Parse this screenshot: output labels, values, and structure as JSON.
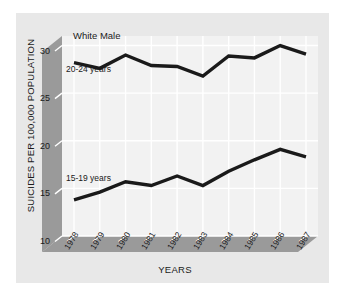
{
  "figure": {
    "background_color": "#ffffff",
    "panel_color": "#e8e8e8",
    "plot_area_color": "#f2f2f2",
    "axis_band_color": "#9a9a9a",
    "gridline_color": "#ffffff",
    "line_color": "#1a1a1a"
  },
  "annotations": {
    "title": "White Male",
    "upper_series_label": "20-24 years",
    "lower_series_label": "15-19 years"
  },
  "axes": {
    "ylabel": "SUICIDES PER 100,000 POPULATION",
    "xlabel": "YEARS",
    "yticks": [
      "30",
      "25",
      "20",
      "15",
      "10"
    ],
    "xticks": [
      "1978",
      "1979",
      "1980",
      "1981",
      "1982",
      "1983",
      "1984",
      "1985",
      "1986",
      "1987"
    ]
  },
  "chart_data": {
    "type": "line",
    "title": "White Male",
    "xlabel": "YEARS",
    "ylabel": "SUICIDES PER 100,000 POPULATION",
    "x": [
      1978,
      1979,
      1980,
      1981,
      1982,
      1983,
      1984,
      1985,
      1986,
      1987
    ],
    "categories": [
      "1978",
      "1979",
      "1980",
      "1981",
      "1982",
      "1983",
      "1984",
      "1985",
      "1986",
      "1987"
    ],
    "ylim": [
      10,
      31
    ],
    "yticks": [
      10,
      15,
      20,
      25,
      30
    ],
    "grid": true,
    "legend": "inline-labels",
    "series": [
      {
        "name": "20-24 years",
        "values": [
          28.2,
          27.6,
          29.0,
          27.9,
          27.8,
          26.8,
          28.9,
          28.7,
          30.0,
          29.1
        ]
      },
      {
        "name": "15-19 years",
        "values": [
          13.8,
          14.6,
          15.7,
          15.3,
          16.3,
          15.3,
          16.8,
          18.0,
          19.1,
          18.3
        ]
      }
    ]
  }
}
